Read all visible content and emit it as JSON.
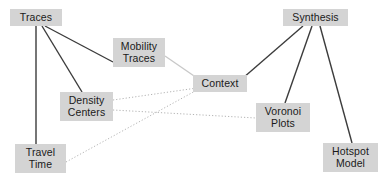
{
  "diagram": {
    "background_color": "#ffffff",
    "node_fill_color": "#d4d4d4",
    "node_text_color": "#1a1a1a",
    "solid_edge_color": "#3c3c3c",
    "light_edge_color": "#c8c8c8",
    "dotted_edge_color": "#b4b4b4",
    "nodes": [
      {
        "id": "traces",
        "label": "Traces",
        "x": 10,
        "y": 9,
        "w": 52,
        "h": 17
      },
      {
        "id": "mobility-traces",
        "label": "Mobility\nTraces",
        "x": 113,
        "y": 38,
        "w": 52,
        "h": 29
      },
      {
        "id": "synthesis",
        "label": "Synthesis",
        "x": 283,
        "y": 9,
        "w": 65,
        "h": 17
      },
      {
        "id": "context",
        "label": "Context",
        "x": 193,
        "y": 75,
        "w": 54,
        "h": 17
      },
      {
        "id": "density-centers",
        "label": "Density\nCenters",
        "x": 60,
        "y": 92,
        "w": 53,
        "h": 29
      },
      {
        "id": "voronoi-plots",
        "label": "Voronoi\nPlots",
        "x": 256,
        "y": 103,
        "w": 54,
        "h": 29
      },
      {
        "id": "travel-time",
        "label": "Travel\nTime",
        "x": 15,
        "y": 144,
        "w": 51,
        "h": 29
      },
      {
        "id": "hotspot-model",
        "label": "Hotspot\nModel",
        "x": 323,
        "y": 143,
        "w": 55,
        "h": 29
      }
    ],
    "edges": [
      {
        "id": "traces-travel-time",
        "from": "traces",
        "to": "travel-time",
        "style": "solid",
        "x1": 36,
        "y1": 26,
        "x2": 36,
        "y2": 144
      },
      {
        "id": "traces-density-centers",
        "from": "traces",
        "to": "density-centers",
        "style": "solid",
        "x1": 42,
        "y1": 26,
        "x2": 82,
        "y2": 92
      },
      {
        "id": "traces-mobility-traces",
        "from": "traces",
        "to": "mobility-traces",
        "style": "solid",
        "x1": 45,
        "y1": 26,
        "x2": 113,
        "y2": 62
      },
      {
        "id": "mobility-traces-context",
        "from": "mobility-traces",
        "to": "context",
        "style": "light",
        "x1": 165,
        "y1": 56,
        "x2": 197,
        "y2": 78
      },
      {
        "id": "synthesis-context",
        "from": "synthesis",
        "to": "context",
        "style": "solid",
        "x1": 303,
        "y1": 26,
        "x2": 243,
        "y2": 78
      },
      {
        "id": "synthesis-voronoi-plots",
        "from": "synthesis",
        "to": "voronoi-plots",
        "style": "solid",
        "x1": 312,
        "y1": 26,
        "x2": 285,
        "y2": 103
      },
      {
        "id": "synthesis-hotspot-model",
        "from": "synthesis",
        "to": "hotspot-model",
        "style": "solid",
        "x1": 320,
        "y1": 26,
        "x2": 352,
        "y2": 143
      },
      {
        "id": "density-centers-context",
        "from": "density-centers",
        "to": "context",
        "style": "dotted",
        "x1": 113,
        "y1": 100,
        "x2": 197,
        "y2": 88
      },
      {
        "id": "density-centers-voronoi",
        "from": "density-centers",
        "to": "voronoi-plots",
        "style": "dotted",
        "x1": 113,
        "y1": 110,
        "x2": 256,
        "y2": 118
      },
      {
        "id": "travel-time-context",
        "from": "travel-time",
        "to": "context",
        "style": "dotted",
        "x1": 66,
        "y1": 162,
        "x2": 197,
        "y2": 90
      }
    ]
  }
}
